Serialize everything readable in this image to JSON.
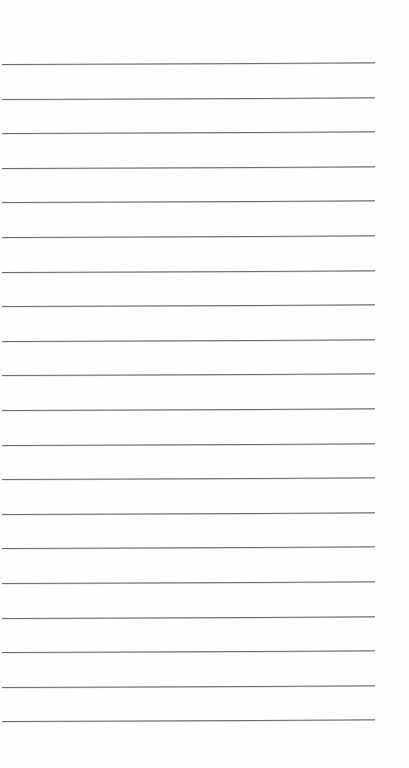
{
  "document": {
    "type": "lined-paper",
    "background_color": "#fefefe",
    "rule_color": "#6a6a6a",
    "rule_count": 20,
    "first_rule_y": 64,
    "rule_spacing": 34.6,
    "rule_left_x": 2,
    "rule_right_x": 375
  }
}
